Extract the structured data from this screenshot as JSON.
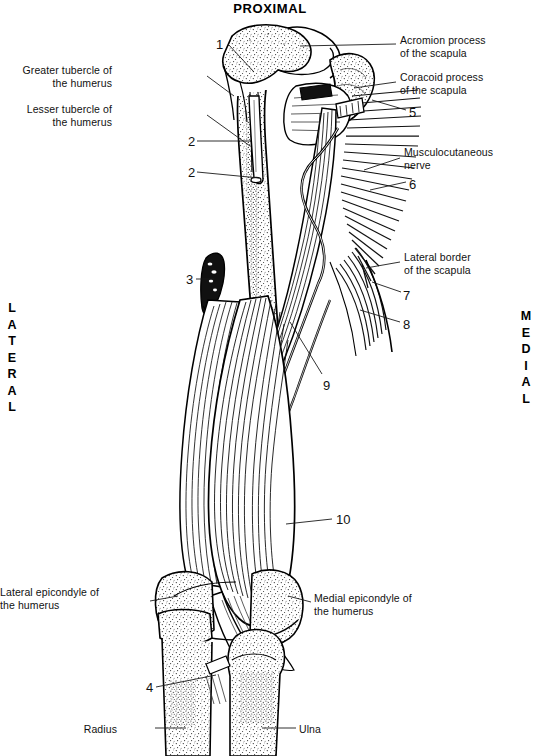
{
  "figure": {
    "title": "PROXIMAL",
    "orientation_left": "LATERAL",
    "orientation_right": "MEDIAL"
  },
  "labels": {
    "left": [
      {
        "id": "greater-tubercle",
        "text": "Greater tubercle of\nthe humerus",
        "x": 112,
        "y": 64
      },
      {
        "id": "lesser-tubercle",
        "text": "Lesser tubercle of\nthe humerus",
        "x": 112,
        "y": 103
      },
      {
        "id": "lateral-epicondyle",
        "text": "Lateral epicondyle of\nthe humerus",
        "x": 44,
        "y": 586
      },
      {
        "id": "radius",
        "text": "Radius",
        "x": 117,
        "y": 723
      }
    ],
    "right": [
      {
        "id": "acromion-process",
        "text": "Acromion process\nof the scapula",
        "x": 400,
        "y": 34
      },
      {
        "id": "coracoid-process",
        "text": "Coracoid process\nof the scapula",
        "x": 400,
        "y": 71
      },
      {
        "id": "musculocutaneous-nerve",
        "text": "Musculocutaneous\nnerve",
        "x": 404,
        "y": 146
      },
      {
        "id": "lateral-border-scapula",
        "text": "Lateral border\nof the scapula",
        "x": 404,
        "y": 251
      },
      {
        "id": "medial-epicondyle",
        "text": "Medial epicondyle of\nthe humerus",
        "x": 314,
        "y": 592
      },
      {
        "id": "ulna",
        "text": "Ulna",
        "x": 299,
        "y": 723
      }
    ],
    "numbers": [
      {
        "id": "num-1",
        "text": "1",
        "x": 216,
        "y": 38
      },
      {
        "id": "num-2a",
        "text": "2",
        "x": 188,
        "y": 135
      },
      {
        "id": "num-2b",
        "text": "2",
        "x": 188,
        "y": 166
      },
      {
        "id": "num-3",
        "text": "3",
        "x": 186,
        "y": 273
      },
      {
        "id": "num-4",
        "text": "4",
        "x": 146,
        "y": 681
      },
      {
        "id": "num-5",
        "text": "5",
        "x": 409,
        "y": 106
      },
      {
        "id": "num-6",
        "text": "6",
        "x": 409,
        "y": 178
      },
      {
        "id": "num-7",
        "text": "7",
        "x": 403,
        "y": 289
      },
      {
        "id": "num-8",
        "text": "8",
        "x": 403,
        "y": 318
      },
      {
        "id": "num-9",
        "text": "9",
        "x": 323,
        "y": 379
      },
      {
        "id": "num-10",
        "text": "10",
        "x": 336,
        "y": 513
      }
    ]
  },
  "colors": {
    "ink": "#000000",
    "background": "#ffffff",
    "leader_line": "#1a1a1a"
  }
}
